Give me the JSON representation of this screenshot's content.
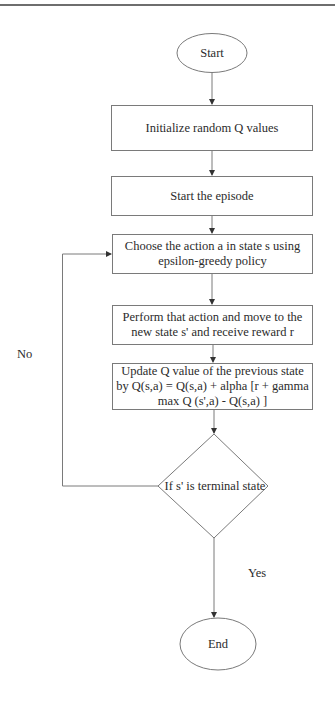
{
  "diagram": {
    "type": "flowchart",
    "colors": {
      "stroke": "#7a7a7a",
      "text": "#2b2b2b",
      "background": "#ffffff"
    },
    "nodes": {
      "start": {
        "shape": "ellipse",
        "label": "Start"
      },
      "init": {
        "shape": "rect",
        "label": "Initialize random Q values"
      },
      "episode": {
        "shape": "rect",
        "label": "Start the episode"
      },
      "choose": {
        "shape": "rect",
        "label": "Choose the action a in state s using epsilon-greedy policy"
      },
      "perform": {
        "shape": "rect",
        "label": "Perform that action and move to the new state s' and receive reward r"
      },
      "update": {
        "shape": "rect",
        "label": "Update Q value of the previous state by Q(s,a) = Q(s,a) + alpha [r + gamma max Q (s',a) - Q(s,a) ]"
      },
      "decision": {
        "shape": "diamond",
        "label": "If s' is terminal state"
      },
      "end": {
        "shape": "ellipse",
        "label": "End"
      }
    },
    "edges": [
      {
        "from": "start",
        "to": "init",
        "label": ""
      },
      {
        "from": "init",
        "to": "episode",
        "label": ""
      },
      {
        "from": "episode",
        "to": "choose",
        "label": ""
      },
      {
        "from": "choose",
        "to": "perform",
        "label": ""
      },
      {
        "from": "perform",
        "to": "update",
        "label": ""
      },
      {
        "from": "update",
        "to": "decision",
        "label": ""
      },
      {
        "from": "decision",
        "to": "choose",
        "label": "No"
      },
      {
        "from": "decision",
        "to": "end",
        "label": "Yes"
      }
    ],
    "edge_labels": {
      "no": "No",
      "yes": "Yes"
    }
  }
}
